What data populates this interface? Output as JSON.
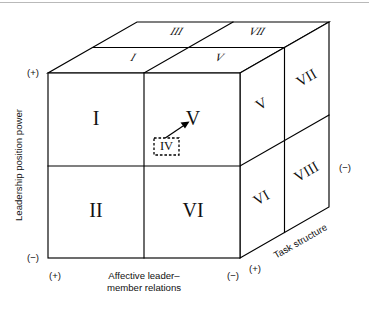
{
  "figure": {
    "name": "fiedler-contingency-cube",
    "type": "3d-cube-octant-diagram",
    "background": "#ffffff",
    "line_color": "#000000"
  },
  "axes": {
    "vertical": {
      "name": "leadership-position-power",
      "label": "Leadership position power",
      "plus_sign": "(+)",
      "minus_sign": "(−)",
      "plus_position": "top",
      "minus_position": "bottom",
      "orientation": "vertical-rotated"
    },
    "horizontal": {
      "name": "affective-leader-member-relations",
      "label_line1": "Affective leader–",
      "label_line2": "member relations",
      "plus_sign": "(+)",
      "minus_sign": "(−)",
      "plus_position": "left",
      "minus_position": "right",
      "orientation": "horizontal"
    },
    "depth": {
      "name": "task-structure",
      "label": "Task structure",
      "plus_sign": "(+)",
      "minus_sign": "(−)",
      "plus_position": "front-bottom-right",
      "minus_position": "back-right",
      "orientation": "diagonal-depth"
    }
  },
  "cells": {
    "front_face": [
      {
        "id": "front-top-left",
        "label": "I"
      },
      {
        "id": "front-top-right",
        "label": "V"
      },
      {
        "id": "front-bottom-left",
        "label": "II"
      },
      {
        "id": "front-bottom-right",
        "label": "VI"
      }
    ],
    "right_face_middle": [
      {
        "id": "side-middle-top",
        "label": "V"
      },
      {
        "id": "side-middle-bottom",
        "label": "VI"
      }
    ],
    "right_face_back": [
      {
        "id": "side-back-top",
        "label": "VII"
      },
      {
        "id": "side-back-bottom",
        "label": "VIII"
      }
    ],
    "top_face": [
      {
        "id": "top-front-left",
        "label": "I"
      },
      {
        "id": "top-front-right",
        "label": "V"
      },
      {
        "id": "top-back-left",
        "label": "III"
      },
      {
        "id": "top-back-right",
        "label": "VII"
      }
    ]
  },
  "callout": {
    "name": "highlighted-octant",
    "label": "IV",
    "style": "dashed-box-with-arrow",
    "points_to": "V"
  }
}
